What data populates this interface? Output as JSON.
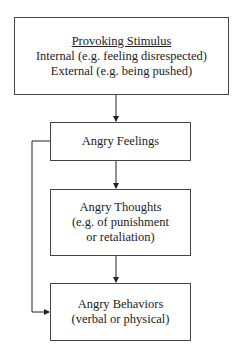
{
  "diagram": {
    "nodes": [
      {
        "id": "stimulus",
        "title": "Provoking Stimulus",
        "lines": [
          "Internal (e.g. feeling disrespected)",
          "External (e.g. being pushed)"
        ]
      },
      {
        "id": "feelings",
        "title": "Angry Feelings",
        "lines": []
      },
      {
        "id": "thoughts",
        "title": "Angry Thoughts",
        "lines": [
          "(e.g. of punishment",
          "or retaliation)"
        ]
      },
      {
        "id": "behaviors",
        "title": "Angry Behaviors",
        "lines": [
          "(verbal or physical)"
        ]
      }
    ],
    "edges": [
      {
        "from": "stimulus",
        "to": "feelings"
      },
      {
        "from": "feelings",
        "to": "thoughts"
      },
      {
        "from": "thoughts",
        "to": "behaviors"
      },
      {
        "from": "feelings",
        "to": "behaviors",
        "route": "left-bypass"
      }
    ]
  }
}
